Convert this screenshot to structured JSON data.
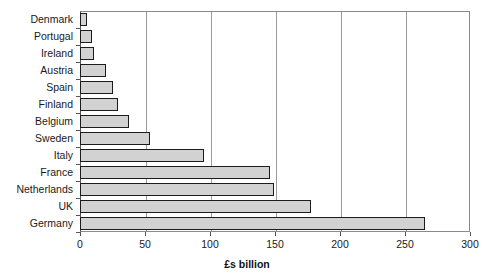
{
  "chart_data": {
    "type": "bar",
    "orientation": "horizontal",
    "title": "",
    "xlabel": "£s billion",
    "ylabel": "",
    "xlim": [
      0,
      300
    ],
    "ylim": null,
    "grid": true,
    "legend": false,
    "xticks": [
      0,
      50,
      100,
      150,
      200,
      250,
      300
    ],
    "categories": [
      "Denmark",
      "Portugal",
      "Ireland",
      "Austria",
      "Spain",
      "Finland",
      "Belgium",
      "Sweden",
      "Italy",
      "France",
      "Netherlands",
      "UK",
      "Germany"
    ],
    "values": [
      5,
      9,
      11,
      20,
      25,
      29,
      38,
      54,
      95,
      146,
      149,
      178,
      265
    ],
    "series": [
      {
        "name": "",
        "values": [
          5,
          9,
          11,
          20,
          25,
          29,
          38,
          54,
          95,
          146,
          149,
          178,
          265
        ]
      }
    ],
    "colors": {
      "bar_fill": "#d2d2d2",
      "bar_border": "#1c1c1c",
      "gridline": "#9a9a9a",
      "axis": "#555555",
      "text": "#1a1a1a",
      "background": "#ffffff"
    }
  }
}
